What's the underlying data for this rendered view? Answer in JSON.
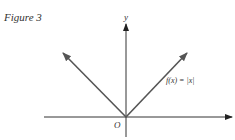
{
  "figure": {
    "caption": "Figure 3",
    "y_axis_label": "y",
    "origin_label": "O",
    "function_label": "f(x) = |x|"
  },
  "colors": {
    "axis": "#333333",
    "graph": "#555555",
    "text": "#333333",
    "background": "#ffffff"
  }
}
